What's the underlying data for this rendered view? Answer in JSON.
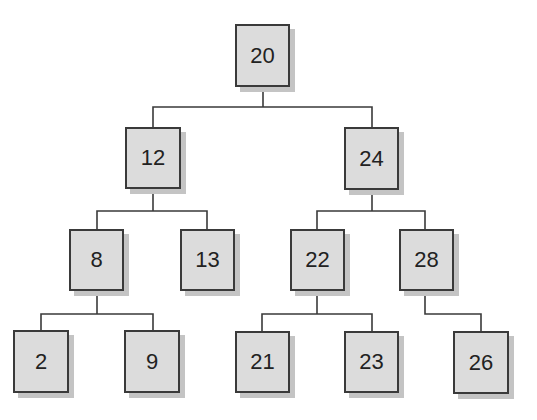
{
  "diagram": {
    "type": "binary-search-tree",
    "nodes": [
      {
        "id": "n20",
        "label": "20",
        "x": 235,
        "y": 24,
        "w": 55,
        "h": 63
      },
      {
        "id": "n12",
        "label": "12",
        "x": 125,
        "y": 127,
        "w": 56,
        "h": 62
      },
      {
        "id": "n24",
        "label": "24",
        "x": 344,
        "y": 127,
        "w": 55,
        "h": 63
      },
      {
        "id": "n8",
        "label": "8",
        "x": 69,
        "y": 229,
        "w": 55,
        "h": 62
      },
      {
        "id": "n13",
        "label": "13",
        "x": 180,
        "y": 229,
        "w": 55,
        "h": 62
      },
      {
        "id": "n22",
        "label": "22",
        "x": 290,
        "y": 229,
        "w": 55,
        "h": 62
      },
      {
        "id": "n28",
        "label": "28",
        "x": 399,
        "y": 229,
        "w": 55,
        "h": 62
      },
      {
        "id": "n2",
        "label": "2",
        "x": 13,
        "y": 330,
        "w": 56,
        "h": 63
      },
      {
        "id": "n9",
        "label": "9",
        "x": 124,
        "y": 330,
        "w": 56,
        "h": 63
      },
      {
        "id": "n21",
        "label": "21",
        "x": 235,
        "y": 331,
        "w": 55,
        "h": 62
      },
      {
        "id": "n23",
        "label": "23",
        "x": 344,
        "y": 331,
        "w": 55,
        "h": 62
      },
      {
        "id": "n26",
        "label": "26",
        "x": 453,
        "y": 331,
        "w": 56,
        "h": 63
      }
    ],
    "edges": [
      {
        "from": "20",
        "to": "12"
      },
      {
        "from": "20",
        "to": "24"
      },
      {
        "from": "12",
        "to": "8"
      },
      {
        "from": "12",
        "to": "13"
      },
      {
        "from": "24",
        "to": "22"
      },
      {
        "from": "24",
        "to": "28"
      },
      {
        "from": "8",
        "to": "2"
      },
      {
        "from": "8",
        "to": "9"
      },
      {
        "from": "22",
        "to": "21"
      },
      {
        "from": "22",
        "to": "23"
      },
      {
        "from": "28",
        "to": "26"
      }
    ],
    "connectors": [
      "263,87 263,107",
      "153,127 153,107 372,107 372,127",
      "153,189 153,211",
      "97,229 97,211 207,211 207,229",
      "372,190 372,211",
      "317,229 317,211 425,211 425,229",
      "97,291 97,314",
      "41,330 41,314 153,314 153,330",
      "317,291 317,314",
      "262,331 262,314 372,314 372,331",
      "425,291 425,314 481,314 481,331"
    ],
    "colors": {
      "fill": "#dcdcdc",
      "border": "#3a3a3a",
      "shadow": "#c4c4c4",
      "line": "#3a3a3a"
    }
  }
}
